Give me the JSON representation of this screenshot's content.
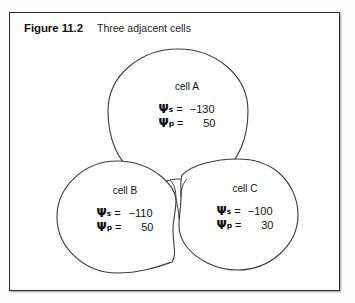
{
  "figure": {
    "number": "Figure 11.2",
    "title": "Three adjacent cells",
    "frame_color": "#2b2b2b",
    "background": "#ffffff",
    "stroke_color": "#3a3a3a"
  },
  "symbols": {
    "psi": "Ψ",
    "sub_s": "s",
    "sub_p": "p",
    "equals": "=",
    "minus": "−"
  },
  "cells": [
    {
      "id": "cell-a",
      "name": "cell A",
      "psi_s_label": "Ψ",
      "psi_s_sub": "s",
      "psi_s_eq": "=",
      "psi_s_value": "−130",
      "psi_p_label": "Ψ",
      "psi_p_sub": "p",
      "psi_p_eq": "=",
      "psi_p_value": "50"
    },
    {
      "id": "cell-b",
      "name": "cell B",
      "psi_s_label": "Ψ",
      "psi_s_sub": "s",
      "psi_s_eq": "=",
      "psi_s_value": "−110",
      "psi_p_label": "Ψ",
      "psi_p_sub": "p",
      "psi_p_eq": "=",
      "psi_p_value": "50"
    },
    {
      "id": "cell-c",
      "name": "cell C",
      "psi_s_label": "Ψ",
      "psi_s_sub": "s",
      "psi_s_eq": "=",
      "psi_s_value": "−100",
      "psi_p_label": "Ψ",
      "psi_p_sub": "p",
      "psi_p_eq": "=",
      "psi_p_value": "30"
    }
  ]
}
